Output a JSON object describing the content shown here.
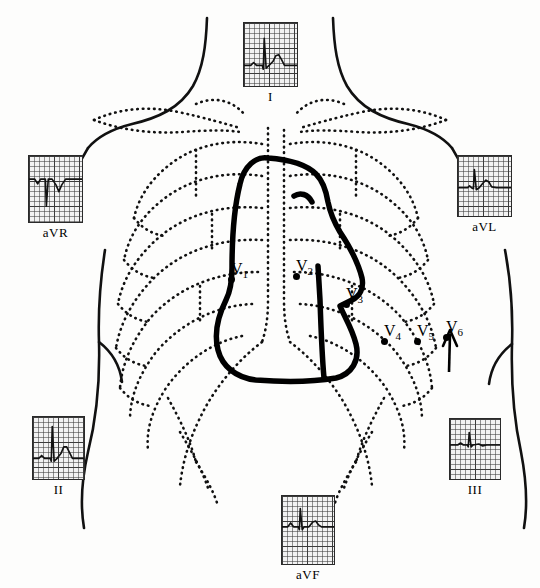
{
  "figure": {
    "kind": "anatomical-diagram",
    "body_outline": "anterior torso with neck, shoulders, arms and flanks",
    "skeleton": "dotted clavicles, sternum, ribs and costal margins",
    "heart": "bold solid cardiac silhouette overlying the mid and left chest"
  },
  "ecg_panels": [
    {
      "id": "I",
      "label": "I",
      "position": "top-center",
      "morphology": "small upright P, tall narrow R spike, broad upright T"
    },
    {
      "id": "aVR",
      "label": "aVR",
      "position": "upper-left",
      "morphology": "inverted P, deep negative QS, inverted T"
    },
    {
      "id": "aVL",
      "label": "aVL",
      "position": "upper-right",
      "morphology": "small upright R spike, low rounded upright T"
    },
    {
      "id": "II",
      "label": "II",
      "position": "lower-left",
      "morphology": "upright P, tall R spike, prominent upright T"
    },
    {
      "id": "III",
      "label": "III",
      "position": "lower-right",
      "morphology": "low-amplitude complexes, small R, flat T"
    },
    {
      "id": "aVF",
      "label": "aVF",
      "position": "bottom-center",
      "morphology": "upright P, narrow R spike, broad low T"
    }
  ],
  "chest_leads": [
    {
      "label": "V",
      "subscript": "1",
      "site": "4th intercostal space, right sternal border"
    },
    {
      "label": "V",
      "subscript": "2",
      "site": "4th intercostal space, left sternal border"
    },
    {
      "label": "V",
      "subscript": "3",
      "site": "midway between V2 and V4"
    },
    {
      "label": "V",
      "subscript": "4",
      "site": "5th intercostal space, midclavicular line"
    },
    {
      "label": "V",
      "subscript": "5",
      "site": "anterior axillary line, level of V4"
    },
    {
      "label": "V",
      "subscript": "6",
      "site": "midaxillary line, level of V4"
    }
  ],
  "colors": {
    "ink": "#000000",
    "paper": "#fdfdfc",
    "grid_minor": "#3c3c3c",
    "grid_major": "#191919",
    "grid_bg": "#f2f2f2"
  }
}
